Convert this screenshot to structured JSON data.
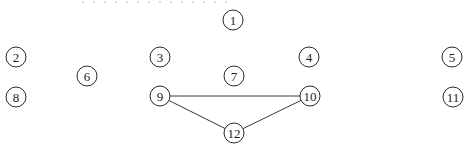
{
  "diagram": {
    "type": "graph",
    "node_radius": 10,
    "colors": {
      "stroke": "#2a2a2a",
      "text": "#1e1e1e",
      "edge": "#3a3a3a",
      "dots": "#b8b8b8"
    },
    "nodes": [
      {
        "id": "1",
        "label": "1",
        "x": 233,
        "y": 20
      },
      {
        "id": "2",
        "label": "2",
        "x": 16,
        "y": 57
      },
      {
        "id": "3",
        "label": "3",
        "x": 160,
        "y": 57
      },
      {
        "id": "4",
        "label": "4",
        "x": 309,
        "y": 57
      },
      {
        "id": "5",
        "label": "5",
        "x": 452,
        "y": 57
      },
      {
        "id": "6",
        "label": "6",
        "x": 87,
        "y": 76
      },
      {
        "id": "7",
        "label": "7",
        "x": 234,
        "y": 76
      },
      {
        "id": "8",
        "label": "8",
        "x": 16,
        "y": 97
      },
      {
        "id": "9",
        "label": "9",
        "x": 160,
        "y": 96
      },
      {
        "id": "10",
        "label": "10",
        "x": 310,
        "y": 96
      },
      {
        "id": "11",
        "label": "11",
        "x": 453,
        "y": 97
      },
      {
        "id": "12",
        "label": "12",
        "x": 234,
        "y": 133
      }
    ],
    "edges": [
      {
        "from": "9",
        "to": "10"
      },
      {
        "from": "9",
        "to": "12"
      },
      {
        "from": "10",
        "to": "12"
      }
    ],
    "top_dots": {
      "x1": 82,
      "x2": 232,
      "y": 2
    }
  }
}
